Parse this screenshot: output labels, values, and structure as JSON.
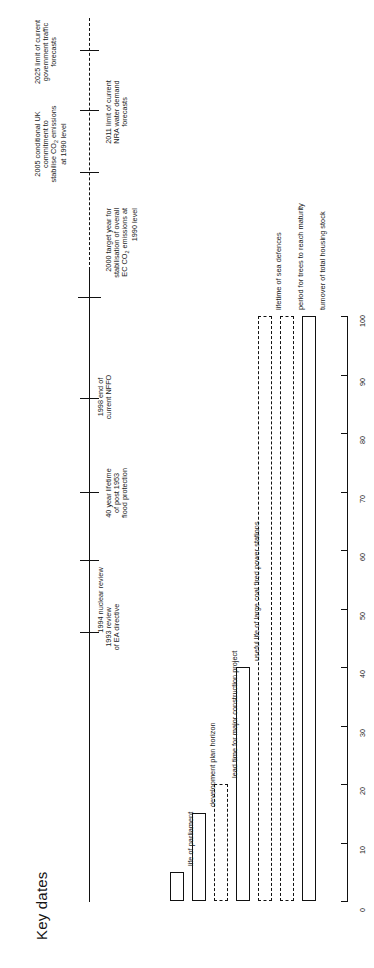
{
  "figure": {
    "title": "Key dates",
    "orientation": "rotated-90-ccw"
  },
  "timeline": {
    "name": "key-dates-timeline",
    "events": [
      {
        "id": "e1993",
        "label": "1993 review\nof EA directive",
        "year": 1993,
        "pos": 0.055
      },
      {
        "id": "e1994",
        "label": "1994 nuclear review",
        "year": 1994,
        "pos": 0.175
      },
      {
        "id": "e1996",
        "label": "40 year lifetime\nof post 1953\nflood protection",
        "year": 1996,
        "pos": 0.29
      },
      {
        "id": "e1998",
        "label": "1998 end of\ncurrent NFFO",
        "year": 1998,
        "pos": 0.455
      },
      {
        "id": "e2000",
        "label": "2000 target year for\nstabilisation of overall\nEC CO2 emissions at\n1990 level",
        "year": 2000,
        "pos": 0.625
      },
      {
        "id": "e2005",
        "label": "2005 conditional UK\ncommitment to\nstabilise CO2 emissions\nat 1990 level",
        "year": 2005,
        "pos": 0.79
      },
      {
        "id": "e2011",
        "label": "2011 limit of current\nNRA water demand\nforecasts",
        "year": 2011,
        "pos": 0.893
      },
      {
        "id": "e2025",
        "label": "2025 limit of current\ngovernment traffic\nforecasts",
        "year": 2025,
        "pos": 0.988
      }
    ]
  },
  "chart_data": {
    "type": "bar",
    "orientation": "horizontal",
    "title": "Key dates",
    "xlabel": "",
    "ylabel": "",
    "xlim": [
      0,
      100
    ],
    "grid": false,
    "legend": "none",
    "tick_labels": [
      "0",
      "10",
      "20",
      "30",
      "40",
      "50",
      "60",
      "70",
      "80",
      "90",
      "100"
    ],
    "ticks": [
      0,
      10,
      20,
      30,
      40,
      50,
      60,
      70,
      80,
      90,
      100
    ],
    "categories": [
      "life of parliament",
      "development plan horizon",
      "lead time for major construction project",
      "useful life of large coal fired power stations",
      "lifetime of sea defences",
      "period for trees to reach maturity",
      "turnover of total housing stock"
    ],
    "values": [
      5,
      15,
      20,
      40,
      100,
      100,
      100
    ],
    "styles": [
      "solid",
      "solid",
      "dashed",
      "solid",
      "dashed",
      "dashed",
      "solid"
    ]
  },
  "axis": {
    "name": "value-axis",
    "min": 0,
    "max": 100
  }
}
